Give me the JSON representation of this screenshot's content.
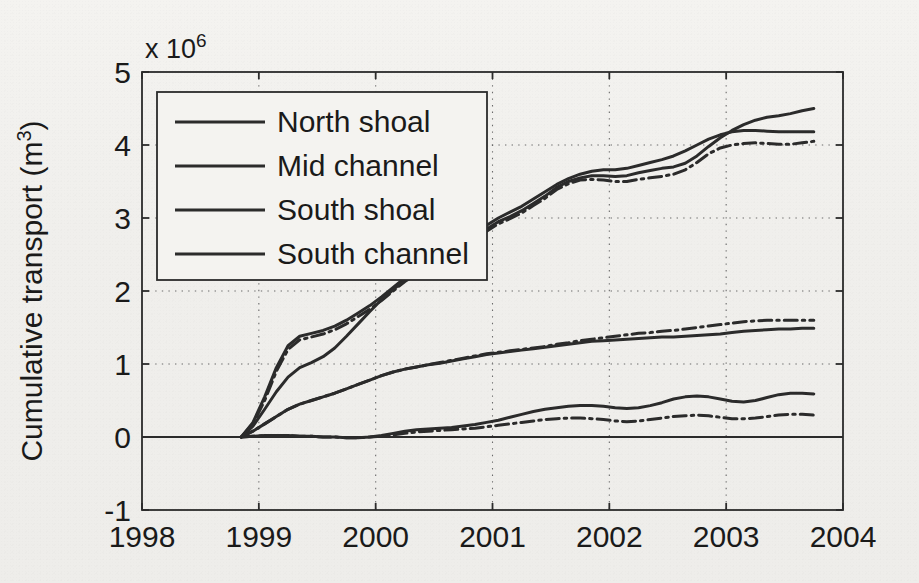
{
  "chart_data": {
    "type": "line",
    "title": "",
    "xlabel": "",
    "ylabel": "Cumulative transport (m",
    "ylabel_exponent": "3",
    "ylabel_suffix": ")",
    "y_multiplier_label": "x 10",
    "y_multiplier_exponent": "6",
    "xlim": [
      1998,
      2004
    ],
    "ylim": [
      -1,
      5
    ],
    "xticks": [
      1998,
      1999,
      2000,
      2001,
      2002,
      2003,
      2004
    ],
    "xtick_labels": [
      "1998",
      "1999",
      "2000",
      "2001",
      "2002",
      "2003",
      "2004"
    ],
    "yticks": [
      -1,
      0,
      1,
      2,
      3,
      4,
      5
    ],
    "ytick_labels": [
      "-1",
      "0",
      "1",
      "2",
      "3",
      "4",
      "5"
    ],
    "grid": "dotted",
    "grid_color": "#6b6b6b",
    "legend_position": "top-left",
    "line_color": "#2b2b2b",
    "zero_line": 0,
    "legend": [
      {
        "label": "North shoal",
        "style": "solid"
      },
      {
        "label": "Mid channel",
        "style": "solid"
      },
      {
        "label": "South shoal",
        "style": "solid"
      },
      {
        "label": "South channel",
        "style": "solid"
      }
    ],
    "x": [
      1998.85,
      1998.95,
      1999.05,
      1999.15,
      1999.25,
      1999.35,
      1999.45,
      1999.55,
      1999.65,
      1999.75,
      1999.85,
      1999.95,
      2000.05,
      2000.15,
      2000.25,
      2000.35,
      2000.45,
      2000.55,
      2000.65,
      2000.75,
      2000.85,
      2000.95,
      2001.05,
      2001.15,
      2001.25,
      2001.35,
      2001.45,
      2001.55,
      2001.65,
      2001.75,
      2001.85,
      2001.95,
      2002.05,
      2002.15,
      2002.25,
      2002.35,
      2002.45,
      2002.55,
      2002.65,
      2002.75,
      2002.85,
      2002.95,
      2003.05,
      2003.15,
      2003.25,
      2003.35,
      2003.45,
      2003.55,
      2003.65,
      2003.75
    ],
    "series": [
      {
        "name": "North shoal",
        "style": "solid",
        "values": [
          0.0,
          0.2,
          0.55,
          0.95,
          1.25,
          1.38,
          1.42,
          1.46,
          1.52,
          1.6,
          1.7,
          1.8,
          1.92,
          2.05,
          2.18,
          2.28,
          2.35,
          2.4,
          2.46,
          2.56,
          2.7,
          2.85,
          2.95,
          3.02,
          3.1,
          3.2,
          3.3,
          3.42,
          3.5,
          3.55,
          3.58,
          3.58,
          3.57,
          3.58,
          3.62,
          3.65,
          3.68,
          3.7,
          3.75,
          3.85,
          3.98,
          4.1,
          4.2,
          4.28,
          4.34,
          4.38,
          4.4,
          4.43,
          4.47,
          4.5
        ]
      },
      {
        "name": "North shoal (variant)",
        "style": "dashdot",
        "values": [
          0.0,
          0.18,
          0.5,
          0.9,
          1.2,
          1.33,
          1.37,
          1.41,
          1.47,
          1.55,
          1.65,
          1.75,
          1.87,
          2.0,
          2.13,
          2.23,
          2.3,
          2.36,
          2.43,
          2.53,
          2.67,
          2.82,
          2.92,
          2.99,
          3.07,
          3.17,
          3.27,
          3.39,
          3.47,
          3.52,
          3.53,
          3.52,
          3.5,
          3.5,
          3.53,
          3.55,
          3.57,
          3.6,
          3.66,
          3.76,
          3.88,
          3.96,
          4.0,
          4.02,
          4.03,
          4.02,
          4.01,
          4.01,
          4.03,
          4.05
        ]
      },
      {
        "name": "South shoal",
        "style": "solid",
        "values": [
          0.0,
          0.15,
          0.38,
          0.62,
          0.82,
          0.95,
          1.02,
          1.1,
          1.22,
          1.38,
          1.55,
          1.72,
          1.88,
          2.02,
          2.15,
          2.25,
          2.33,
          2.4,
          2.5,
          2.62,
          2.76,
          2.9,
          3.0,
          3.08,
          3.16,
          3.26,
          3.36,
          3.46,
          3.54,
          3.6,
          3.64,
          3.66,
          3.66,
          3.68,
          3.72,
          3.76,
          3.8,
          3.85,
          3.92,
          4.0,
          4.08,
          4.14,
          4.18,
          4.2,
          4.2,
          4.19,
          4.18,
          4.18,
          4.18,
          4.18
        ]
      },
      {
        "name": "Mid channel",
        "style": "solid",
        "values": [
          0.0,
          0.08,
          0.18,
          0.28,
          0.38,
          0.45,
          0.5,
          0.55,
          0.6,
          0.66,
          0.72,
          0.78,
          0.84,
          0.89,
          0.93,
          0.96,
          0.99,
          1.01,
          1.04,
          1.07,
          1.1,
          1.13,
          1.15,
          1.17,
          1.19,
          1.21,
          1.23,
          1.25,
          1.27,
          1.29,
          1.31,
          1.32,
          1.33,
          1.34,
          1.35,
          1.36,
          1.37,
          1.37,
          1.38,
          1.39,
          1.4,
          1.41,
          1.43,
          1.45,
          1.46,
          1.47,
          1.48,
          1.48,
          1.49,
          1.49
        ]
      },
      {
        "name": "Mid channel (variant)",
        "style": "dashdot",
        "values": [
          0.0,
          0.08,
          0.18,
          0.28,
          0.38,
          0.45,
          0.5,
          0.55,
          0.6,
          0.66,
          0.72,
          0.78,
          0.84,
          0.89,
          0.93,
          0.96,
          0.99,
          1.02,
          1.05,
          1.08,
          1.11,
          1.14,
          1.16,
          1.18,
          1.2,
          1.22,
          1.24,
          1.27,
          1.29,
          1.32,
          1.34,
          1.36,
          1.38,
          1.4,
          1.42,
          1.43,
          1.45,
          1.46,
          1.48,
          1.5,
          1.52,
          1.54,
          1.56,
          1.58,
          1.59,
          1.6,
          1.6,
          1.6,
          1.6,
          1.6
        ]
      },
      {
        "name": "South channel",
        "style": "solid",
        "values": [
          0.0,
          0.01,
          0.02,
          0.02,
          0.02,
          0.01,
          0.01,
          0.0,
          0.0,
          -0.01,
          -0.01,
          0.0,
          0.02,
          0.05,
          0.08,
          0.1,
          0.11,
          0.12,
          0.13,
          0.15,
          0.17,
          0.2,
          0.23,
          0.27,
          0.31,
          0.35,
          0.38,
          0.4,
          0.42,
          0.43,
          0.43,
          0.42,
          0.4,
          0.39,
          0.4,
          0.43,
          0.47,
          0.52,
          0.55,
          0.56,
          0.55,
          0.52,
          0.49,
          0.48,
          0.5,
          0.54,
          0.58,
          0.6,
          0.6,
          0.59
        ]
      },
      {
        "name": "South channel (variant)",
        "style": "dashdot",
        "values": [
          0.0,
          0.01,
          0.02,
          0.02,
          0.02,
          0.01,
          0.01,
          0.0,
          0.0,
          -0.01,
          -0.01,
          0.0,
          0.01,
          0.03,
          0.05,
          0.07,
          0.08,
          0.09,
          0.1,
          0.11,
          0.12,
          0.14,
          0.16,
          0.18,
          0.2,
          0.22,
          0.24,
          0.25,
          0.26,
          0.26,
          0.25,
          0.24,
          0.22,
          0.21,
          0.22,
          0.24,
          0.26,
          0.28,
          0.29,
          0.3,
          0.29,
          0.27,
          0.25,
          0.25,
          0.26,
          0.28,
          0.3,
          0.31,
          0.31,
          0.3
        ]
      }
    ]
  }
}
